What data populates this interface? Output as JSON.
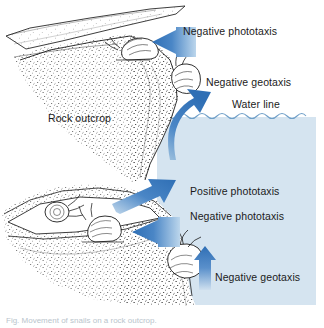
{
  "figure": {
    "caption": "Fig. Movement of snails on a rock outcrop.",
    "colors": {
      "arrow_dark": "#2f6fb5",
      "arrow_mid": "#4a86c6",
      "arrow_light": "#bcd6ec",
      "water_fill": "#d5e4f0",
      "water_line": "#6f9fc8",
      "ink": "#1b1b1b",
      "background": "#ffffff"
    }
  },
  "labels": {
    "negative_phototaxis_top": "Negative phototaxis",
    "negative_geotaxis_top": "Negative geotaxis",
    "water_line": "Water line",
    "rock_outcrop": "Rock outcrop",
    "positive_phototaxis": "Positive phototaxis",
    "negative_phototaxis_bottom": "Negative phototaxis",
    "negative_geotaxis_bottom": "Negative geotaxis"
  },
  "arrows": [
    {
      "name": "negative-phototaxis-top-arrow",
      "direction": "left",
      "label": "Negative phototaxis"
    },
    {
      "name": "negative-geotaxis-top-arrow",
      "direction": "up-curved",
      "label": "Negative geotaxis"
    },
    {
      "name": "positive-phototaxis-arrow",
      "direction": "up-right",
      "label": "Positive phototaxis"
    },
    {
      "name": "negative-phototaxis-bottom-arrow",
      "direction": "left",
      "label": "Negative phototaxis"
    },
    {
      "name": "negative-geotaxis-bottom-arrow",
      "direction": "up",
      "label": "Negative geotaxis"
    }
  ],
  "organisms": [
    {
      "name": "snail-under-ledge",
      "position": "beneath upper overhang"
    },
    {
      "name": "snail-upper-rock-face",
      "position": "upper rock edge at water line"
    },
    {
      "name": "snail-crevice-left",
      "position": "inside lower crevice, left"
    },
    {
      "name": "snail-crevice-right",
      "position": "inside lower crevice, right"
    },
    {
      "name": "snail-submerged",
      "position": "lower rock face, underwater"
    }
  ]
}
